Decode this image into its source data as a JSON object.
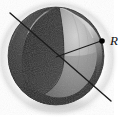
{
  "figure": {
    "name": "sphere-cutaway-radius-diagram",
    "type": "grayscale-technical-illustration",
    "background_color": "#ffffff",
    "canvas": {
      "width": 126,
      "height": 119
    }
  },
  "labels": {
    "radius": "R"
  },
  "sphere": {
    "center_x": 56,
    "center_y": 56,
    "radius_x": 48,
    "radius_y": 49,
    "surface_dark": "#2a2a2a",
    "surface_mid": "#4a4a4a",
    "surface_light": "#8c8c8c",
    "surface_highlight": "#b4b4b4",
    "interior_light": "#c8c8c8",
    "interior_mid": "#9a9a9a",
    "interior_dark": "#5a5a5a",
    "rim_highlight": "#e6e6e6",
    "shadow_color": "#d9d9d9",
    "outline_color": "#1a1a1a"
  },
  "diameter_line": {
    "name": "diameter-line",
    "x1": 10,
    "y1": 13,
    "x2": 111,
    "y2": 101,
    "color": "#1c1c1c",
    "width": 1.4
  },
  "radius_line": {
    "name": "radius-line",
    "x1": 56,
    "y1": 57,
    "x2": 101,
    "y2": 41,
    "color": "#1c1c1c",
    "width": 1.1
  },
  "radius_point": {
    "name": "radius-endpoint-dot",
    "cx": 102,
    "cy": 41,
    "r": 2.8,
    "color": "#000000"
  },
  "radius_label_position": {
    "x": 110,
    "y": 45
  }
}
